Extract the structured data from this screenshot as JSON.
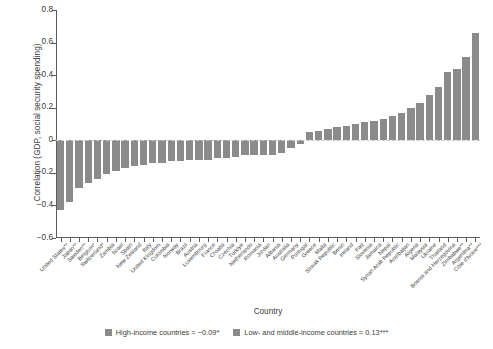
{
  "chart_data": {
    "type": "bar",
    "title": "",
    "xlabel": "Country",
    "ylabel": "Correlation (GDP, social security spending)",
    "ylim": [
      -0.6,
      0.8
    ],
    "yticks": [
      -0.6,
      -0.4,
      -0.2,
      0,
      0.2,
      0.4,
      0.6,
      0.8
    ],
    "ytick_labels": [
      "−0.6",
      "−0.4",
      "−0.2",
      "0",
      "0.2",
      "0.4",
      "0.6",
      "0.8"
    ],
    "grid": false,
    "legend_position": "bottom",
    "bar_color": "#8b8b8b",
    "categories": [
      "United States**",
      "Japan**",
      "Sweden**",
      "Belgium*",
      "Switzerland*",
      "Zambia",
      "Israel",
      "Spain",
      "New Zealand",
      "Italy",
      "United Kingdom",
      "Colombia",
      "Norway",
      "Brazil",
      "Austria",
      "Luxembourg",
      "France",
      "Croatia",
      "Czechia",
      "Türkiye",
      "Netherlands",
      "Romania",
      "Jordan",
      "Albania",
      "Australia",
      "Germany",
      "Portugal",
      "Greece",
      "Malta",
      "Slovak Republic",
      "Benin",
      "Ireland",
      "Iraq",
      "Slovenia",
      "Jamaica",
      "Nepal",
      "Syrian Arab Republic",
      "Azerbaijan",
      "Algeria",
      "Malaysia",
      "Ukraine",
      "Thailand",
      "Bosnia and Herzegovina",
      "Zimbabwe**",
      "Argentina**",
      "Côte d'Ivoire***"
    ],
    "values": [
      -0.43,
      -0.38,
      -0.29,
      -0.26,
      -0.24,
      -0.21,
      -0.19,
      -0.17,
      -0.16,
      -0.15,
      -0.14,
      -0.14,
      -0.13,
      -0.13,
      -0.12,
      -0.12,
      -0.12,
      -0.11,
      -0.11,
      -0.1,
      -0.09,
      -0.09,
      -0.09,
      -0.09,
      -0.08,
      -0.05,
      -0.02,
      0.05,
      0.06,
      0.07,
      0.08,
      0.09,
      0.1,
      0.11,
      0.12,
      0.13,
      0.15,
      0.17,
      0.2,
      0.23,
      0.28,
      0.33,
      0.42,
      0.44,
      0.51,
      0.66
    ],
    "legend": [
      {
        "label": "High-income countries = −0.09*",
        "color": "#8b8b8b"
      },
      {
        "label": "Low- and middle-income countries = 0.13***",
        "color": "#8b8b8b"
      }
    ]
  }
}
